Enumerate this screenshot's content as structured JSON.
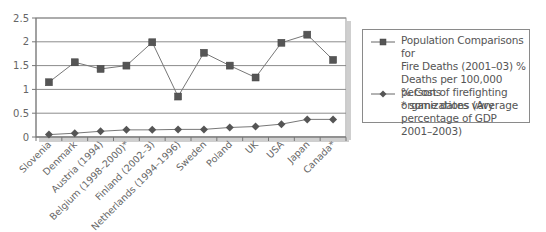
{
  "chart_data": {
    "type": "line",
    "title": "",
    "xlabel": "",
    "ylabel": "",
    "ylim": [
      0,
      2.5
    ],
    "yticks": [
      "0",
      "0.5",
      "1",
      "1.5",
      "2",
      "2.5"
    ],
    "grid": true,
    "legend_position": "right",
    "categories": [
      "Slovenia",
      "Denmark",
      "Austria (1994)",
      "Belgium (1998–2000)*",
      "Finland (2002–3)",
      "Netherlands (1994–1996)",
      "Sweden",
      "Poland",
      "UK",
      "USA",
      "Japan",
      "Canada*"
    ],
    "series": [
      {
        "name": "Population Comparisons for Fire Deaths (2001–03) % Deaths per 100,000 persons * some dates vary",
        "marker": "square",
        "color": "#555555",
        "values": [
          1.15,
          1.57,
          1.43,
          1.5,
          1.99,
          0.85,
          1.77,
          1.5,
          1.25,
          1.98,
          2.15,
          1.62
        ]
      },
      {
        "name": "% Cost of firefighting organizations (Average percentage of GDP 2001–2003)",
        "marker": "diamond",
        "color": "#555555",
        "values": [
          0.05,
          0.08,
          0.12,
          0.15,
          0.15,
          0.16,
          0.16,
          0.2,
          0.22,
          0.27,
          0.37,
          0.37
        ]
      }
    ]
  },
  "legend": {
    "items": [
      {
        "label": "Population Comparisons for\nFire Deaths (2001–03) %\nDeaths per 100,000 persons\n* some dates vary",
        "marker": "square"
      },
      {
        "label": "% Cost of firefighting\norganizations (Average\npercentage of GDP 2001–2003)",
        "marker": "diamond"
      }
    ]
  }
}
